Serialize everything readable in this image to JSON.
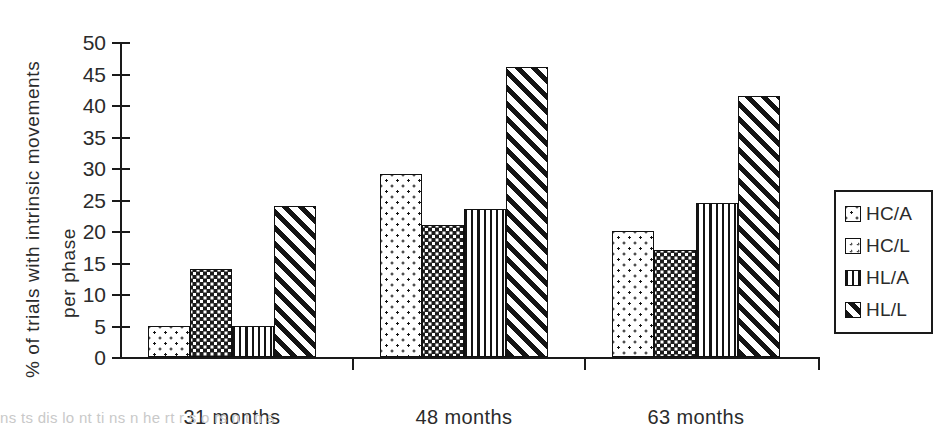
{
  "chart_data": {
    "type": "bar",
    "title": "",
    "xlabel": "",
    "ylabel": "% of trials with intrinsic movements per phase",
    "ylabel_lines": [
      "% of trials with intrinsic movements",
      "per phase"
    ],
    "categories": [
      "31 months",
      "48 months",
      "63 months"
    ],
    "series": [
      {
        "name": "HC/A",
        "pattern": "sparse-dots",
        "values": [
          5,
          29,
          20
        ]
      },
      {
        "name": "HC/L",
        "pattern": "dense-dots",
        "values": [
          14,
          21,
          17
        ]
      },
      {
        "name": "HL/A",
        "pattern": "vertical-lines",
        "values": [
          5,
          23.5,
          24.5
        ]
      },
      {
        "name": "HL/L",
        "pattern": "diagonal-lines",
        "values": [
          24,
          46,
          41.5
        ]
      }
    ],
    "ylim": [
      0,
      50
    ],
    "yticks": [
      0,
      5,
      10,
      15,
      20,
      25,
      30,
      35,
      40,
      45,
      50
    ],
    "ytick_labels": [
      "0",
      "5",
      "10",
      "15",
      "20",
      "25",
      "30",
      "35",
      "40",
      "45",
      "50"
    ],
    "grid": false,
    "legend_position": "right",
    "legend_entries": [
      "HC/A",
      "HC/L",
      "HL/A",
      "HL/L"
    ],
    "colors": {
      "ink": "#141414",
      "background": "#ffffff"
    }
  },
  "axis": {
    "y_title_line1": "% of trials with intrinsic movements",
    "y_title_line2": "per phase"
  },
  "legend": {
    "items": [
      {
        "label": "HC/A"
      },
      {
        "label": "HC/L"
      },
      {
        "label": "HL/A"
      },
      {
        "label": "HL/L"
      }
    ]
  },
  "caption_remnant": "ns  ts dis  lo    nt  ti  ns  n  he    rt  r  s  o    rs   n   t  n  s"
}
